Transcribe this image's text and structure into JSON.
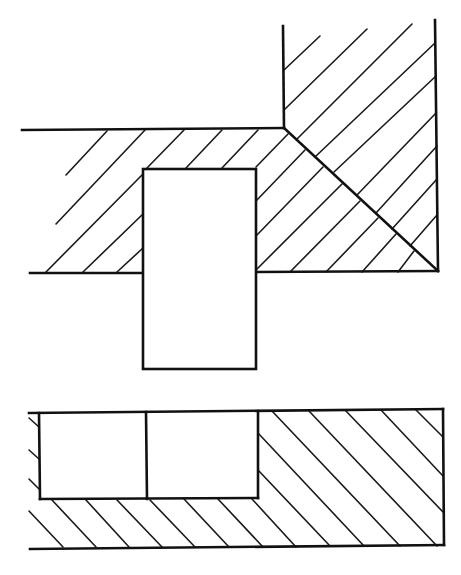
{
  "diagram": {
    "type": "engineering-section-drawing",
    "colors": {
      "line": "#111111",
      "background": "#ffffff"
    },
    "outlines": [
      {
        "name": "upper-horizontal-member-top-edge",
        "x1": 22,
        "y1": 130,
        "x2": 284,
        "y2": 128
      },
      {
        "name": "upper-vertical-member-left-edge",
        "x1": 283,
        "y1": 26,
        "x2": 284,
        "y2": 128
      },
      {
        "name": "upper-vertical-member-right-edge",
        "x1": 435,
        "y1": 20,
        "x2": 438,
        "y2": 271
      },
      {
        "name": "mitre-line",
        "x1": 284,
        "y1": 128,
        "x2": 438,
        "y2": 271
      },
      {
        "name": "upper-bottom-edge-left",
        "x1": 30,
        "y1": 273,
        "x2": 144,
        "y2": 273
      },
      {
        "name": "upper-bottom-edge-right",
        "x1": 256,
        "y1": 272,
        "x2": 438,
        "y2": 271
      },
      {
        "name": "lower-block-top-edge",
        "x1": 29,
        "y1": 413,
        "x2": 443,
        "y2": 409
      },
      {
        "name": "lower-block-right-edge",
        "x1": 443,
        "y1": 409,
        "x2": 444,
        "y2": 545
      },
      {
        "name": "lower-block-bottom-edge",
        "x1": 30,
        "y1": 549,
        "x2": 444,
        "y2": 545
      },
      {
        "name": "recess-left-wall",
        "x1": 39,
        "y1": 413,
        "x2": 40,
        "y2": 499
      },
      {
        "name": "recess-right-wall",
        "x1": 258,
        "y1": 411,
        "x2": 258,
        "y2": 498
      },
      {
        "name": "recess-bottom",
        "x1": 40,
        "y1": 499,
        "x2": 258,
        "y2": 498
      },
      {
        "name": "recess-divider",
        "x1": 146,
        "y1": 412,
        "x2": 147,
        "y2": 499
      }
    ],
    "insert_rect": {
      "name": "key-insert",
      "x": 143,
      "y": 169,
      "width": 113,
      "height": 200
    },
    "hatches": {
      "upper_left": [
        {
          "x1": 66,
          "y1": 175,
          "x2": 107,
          "y2": 131
        },
        {
          "x1": 56,
          "y1": 224,
          "x2": 145,
          "y2": 130
        },
        {
          "x1": 46,
          "y1": 272,
          "x2": 143,
          "y2": 174
        },
        {
          "x1": 83,
          "y1": 272,
          "x2": 143,
          "y2": 214
        },
        {
          "x1": 117,
          "y1": 272,
          "x2": 143,
          "y2": 248
        },
        {
          "x1": 147,
          "y1": 168,
          "x2": 184,
          "y2": 130
        },
        {
          "x1": 186,
          "y1": 168,
          "x2": 222,
          "y2": 130
        },
        {
          "x1": 222,
          "y1": 168,
          "x2": 258,
          "y2": 130
        }
      ],
      "upper_right": [
        {
          "x1": 284,
          "y1": 70,
          "x2": 320,
          "y2": 36
        },
        {
          "x1": 284,
          "y1": 110,
          "x2": 367,
          "y2": 29
        },
        {
          "x1": 297,
          "y1": 139,
          "x2": 412,
          "y2": 24
        },
        {
          "x1": 316,
          "y1": 156,
          "x2": 435,
          "y2": 43
        },
        {
          "x1": 334,
          "y1": 172,
          "x2": 436,
          "y2": 76
        },
        {
          "x1": 357,
          "y1": 195,
          "x2": 436,
          "y2": 113
        },
        {
          "x1": 376,
          "y1": 213,
          "x2": 437,
          "y2": 146
        },
        {
          "x1": 392,
          "y1": 229,
          "x2": 437,
          "y2": 179
        },
        {
          "x1": 410,
          "y1": 246,
          "x2": 437,
          "y2": 215
        },
        {
          "x1": 284,
          "y1": 128,
          "x2": 284,
          "y2": 128
        }
      ],
      "upper_middle": [
        {
          "x1": 256,
          "y1": 167,
          "x2": 288,
          "y2": 134
        },
        {
          "x1": 256,
          "y1": 201,
          "x2": 305,
          "y2": 150
        },
        {
          "x1": 256,
          "y1": 236,
          "x2": 323,
          "y2": 167
        },
        {
          "x1": 256,
          "y1": 270,
          "x2": 342,
          "y2": 184
        },
        {
          "x1": 290,
          "y1": 272,
          "x2": 360,
          "y2": 201
        },
        {
          "x1": 326,
          "y1": 272,
          "x2": 378,
          "y2": 218
        },
        {
          "x1": 362,
          "y1": 272,
          "x2": 396,
          "y2": 234
        },
        {
          "x1": 398,
          "y1": 272,
          "x2": 414,
          "y2": 251
        }
      ],
      "lower_left_edge": [
        {
          "x1": 29,
          "y1": 418,
          "x2": 39,
          "y2": 427
        },
        {
          "x1": 29,
          "y1": 450,
          "x2": 39,
          "y2": 459
        },
        {
          "x1": 29,
          "y1": 479,
          "x2": 39,
          "y2": 489
        }
      ],
      "lower_bottom_strip": [
        {
          "x1": 29,
          "y1": 511,
          "x2": 63,
          "y2": 547
        },
        {
          "x1": 52,
          "y1": 500,
          "x2": 96,
          "y2": 547
        },
        {
          "x1": 86,
          "y1": 500,
          "x2": 129,
          "y2": 547
        },
        {
          "x1": 117,
          "y1": 500,
          "x2": 162,
          "y2": 547
        },
        {
          "x1": 150,
          "y1": 500,
          "x2": 195,
          "y2": 547
        },
        {
          "x1": 184,
          "y1": 499,
          "x2": 229,
          "y2": 547
        },
        {
          "x1": 218,
          "y1": 499,
          "x2": 263,
          "y2": 547
        }
      ],
      "lower_right_block": [
        {
          "x1": 272,
          "y1": 411,
          "x2": 400,
          "y2": 546
        },
        {
          "x1": 309,
          "y1": 411,
          "x2": 437,
          "y2": 546
        },
        {
          "x1": 345,
          "y1": 410,
          "x2": 443,
          "y2": 512
        },
        {
          "x1": 381,
          "y1": 410,
          "x2": 443,
          "y2": 476
        },
        {
          "x1": 416,
          "y1": 410,
          "x2": 443,
          "y2": 437
        },
        {
          "x1": 258,
          "y1": 433,
          "x2": 364,
          "y2": 546
        },
        {
          "x1": 258,
          "y1": 470,
          "x2": 330,
          "y2": 546
        },
        {
          "x1": 252,
          "y1": 499,
          "x2": 296,
          "y2": 547
        }
      ]
    }
  }
}
